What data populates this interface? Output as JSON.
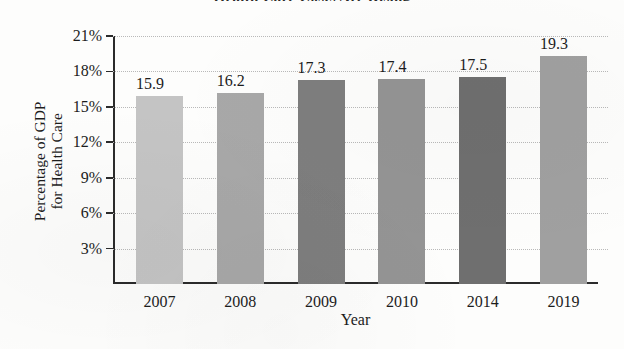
{
  "chart_data": {
    "type": "bar",
    "title": "",
    "title_cropped": "Health Care Costs Are Rising",
    "categories": [
      "2007",
      "2008",
      "2009",
      "2010",
      "2014",
      "2019"
    ],
    "values": [
      15.9,
      16.2,
      17.3,
      17.4,
      17.5,
      19.3
    ],
    "value_labels": [
      "15.9",
      "16.2",
      "17.3",
      "17.4",
      "17.5",
      "19.3"
    ],
    "bar_colors": [
      "#c4c4c4",
      "#a8a8a8",
      "#7e7e7e",
      "#949494",
      "#6f6f6f",
      "#a0a0a0"
    ],
    "xlabel": "Year",
    "ylabel_line1": "Percentage of GDP",
    "ylabel_line2": "for Health Care",
    "ylim": [
      0,
      21
    ],
    "ytick_values": [
      3,
      6,
      9,
      12,
      15,
      18,
      21
    ],
    "ytick_labels": [
      "3%",
      "6%",
      "9%",
      "12%",
      "15%",
      "18%",
      "21%"
    ],
    "grid": true,
    "grid_style": "dotted-horizontal",
    "legend": "none",
    "axis_color": "#2b2b2b",
    "grid_color": "#b9b9b9",
    "background": "#fdfdfc"
  }
}
